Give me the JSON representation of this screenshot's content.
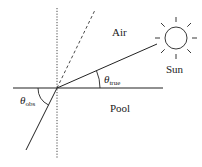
{
  "labels": {
    "air": "Air",
    "sun": "Sun",
    "pool": "Pool",
    "theta_true": {
      "symbol": "θ",
      "sub": "true"
    },
    "theta_obs": {
      "symbol": "θ",
      "sub": "obs"
    }
  },
  "colors": {
    "line": "#222222",
    "background": "#ffffff"
  }
}
